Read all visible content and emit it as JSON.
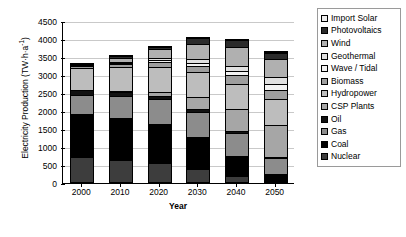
{
  "chart_data": {
    "type": "bar",
    "stacked": true,
    "title": "",
    "xlabel": "Year",
    "ylabel": "Electricity Production (TW·h·a⁻¹)",
    "ylabel_base": "Electricity Production (TW·h·a",
    "ylabel_exp": "-1",
    "ylabel_close": ")",
    "categories": [
      "2000",
      "2010",
      "2020",
      "2030",
      "2040",
      "2050"
    ],
    "ylim": [
      0,
      4500
    ],
    "ytick_step": 500,
    "ytick_labels": [
      "0",
      "500",
      "1000",
      "1500",
      "2000",
      "2500",
      "3000",
      "3500",
      "4000",
      "4500"
    ],
    "grid": true,
    "legend_position": "right",
    "totals": [
      3250,
      3500,
      3750,
      4000,
      3950,
      3600
    ],
    "series": [
      {
        "name": "Nuclear",
        "color": "#3d3d3d",
        "values": [
          700,
          620,
          520,
          360,
          170,
          0
        ]
      },
      {
        "name": "Coal",
        "color": "#000000",
        "values": [
          1200,
          1150,
          1080,
          880,
          560,
          230
        ]
      },
      {
        "name": "Gas",
        "color": "#8c8c8c",
        "values": [
          530,
          620,
          700,
          700,
          620,
          430
        ]
      },
      {
        "name": "Oil",
        "color": "#111111",
        "values": [
          120,
          110,
          95,
          80,
          55,
          30
        ]
      },
      {
        "name": "CSP Plants",
        "color": "#a6a6a6",
        "values": [
          0,
          30,
          120,
          330,
          620,
          900
        ]
      },
      {
        "name": "Hydropower",
        "color": "#bdbdbd",
        "values": [
          620,
          660,
          690,
          700,
          710,
          720
        ]
      },
      {
        "name": "Biomass",
        "color": "#9e9e9e",
        "values": [
          40,
          80,
          130,
          180,
          230,
          260
        ]
      },
      {
        "name": "Wave / Tidal",
        "color": "#f2f2f2",
        "values": [
          0,
          20,
          45,
          80,
          120,
          160
        ]
      },
      {
        "name": "Geothermal",
        "color": "#e0e0e0",
        "values": [
          20,
          40,
          70,
          110,
          150,
          180
        ]
      },
      {
        "name": "Wind",
        "color": "#b0b0b0",
        "values": [
          20,
          120,
          250,
          420,
          520,
          500
        ]
      },
      {
        "name": "Photovoltaics",
        "color": "#2b2b2b",
        "values": [
          0,
          50,
          50,
          160,
          195,
          180
        ]
      },
      {
        "name": "Import Solar",
        "color": "#ededed",
        "values": [
          0,
          0,
          0,
          0,
          0,
          10
        ]
      }
    ]
  },
  "legend": {
    "entries": [
      {
        "label": "Import Solar",
        "color": "#ededed"
      },
      {
        "label": "Photovoltaics",
        "color": "#2b2b2b"
      },
      {
        "label": "Wind",
        "color": "#b0b0b0"
      },
      {
        "label": "Geothermal",
        "color": "#e0e0e0"
      },
      {
        "label": "Wave / Tidal",
        "color": "#f2f2f2"
      },
      {
        "label": "Biomass",
        "color": "#9e9e9e"
      },
      {
        "label": "Hydropower",
        "color": "#bdbdbd"
      },
      {
        "label": "CSP Plants",
        "color": "#a6a6a6"
      },
      {
        "label": "Oil",
        "color": "#111111"
      },
      {
        "label": "Gas",
        "color": "#8c8c8c"
      },
      {
        "label": "Coal",
        "color": "#000000"
      },
      {
        "label": "Nuclear",
        "color": "#3d3d3d"
      }
    ]
  }
}
